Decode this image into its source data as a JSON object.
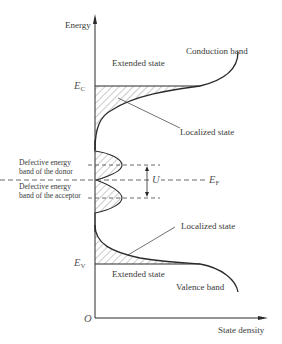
{
  "diagram": {
    "axes": {
      "y_label": "Energy",
      "x_label": "State density",
      "origin_label": "O"
    },
    "levels": {
      "ec": {
        "main": "E",
        "sub": "C"
      },
      "ev": {
        "main": "E",
        "sub": "V"
      },
      "ef": {
        "main": "E",
        "sub": "F"
      },
      "u": "U"
    },
    "labels": {
      "extended_state_top": "Extended state",
      "conduction_band": "Conduction band",
      "localized_state_top": "Localized state",
      "donor_band_line1": "Defective energy",
      "donor_band_line2": "band of the donor",
      "acceptor_band_line1": "Defective energy",
      "acceptor_band_line2": "band of the acceptor",
      "localized_state_bottom": "Localized state",
      "extended_state_bottom": "Extended state",
      "valence_band": "Valence band"
    },
    "colors": {
      "line": "#2a2a2a",
      "text": "#3a3a3a",
      "hatch": "#6a6a6a"
    }
  }
}
